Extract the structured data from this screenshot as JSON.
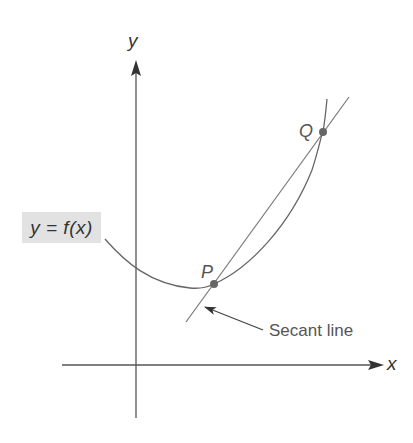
{
  "diagram": {
    "axes": {
      "x_label": "x",
      "y_label": "y"
    },
    "function_label": "y = f(x)",
    "points": [
      {
        "name": "P",
        "label": "P"
      },
      {
        "name": "Q",
        "label": "Q"
      }
    ],
    "annotation": "Secant line",
    "colors": {
      "line": "#666666",
      "axis": "#555555",
      "point": "#666666",
      "label_bg": "#e2e2e2",
      "text": "#555555"
    }
  }
}
